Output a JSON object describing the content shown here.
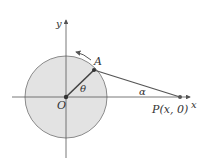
{
  "diagram": {
    "type": "geometry",
    "colors": {
      "circle_fill": "#e3e3e3",
      "circle_stroke": "#8a8a8a",
      "line": "#555555",
      "axis": "#555555",
      "point": "#333333"
    },
    "labels": {
      "y_axis": "y",
      "x_axis": "x",
      "origin": "O",
      "point_a": "A",
      "angle_theta": "θ",
      "angle_alpha": "α",
      "point_p": "P(x, 0)"
    },
    "geometry": {
      "origin": [
        66,
        97
      ],
      "radius": 41,
      "point_a": [
        94,
        70
      ],
      "point_p": [
        180,
        97
      ]
    }
  }
}
